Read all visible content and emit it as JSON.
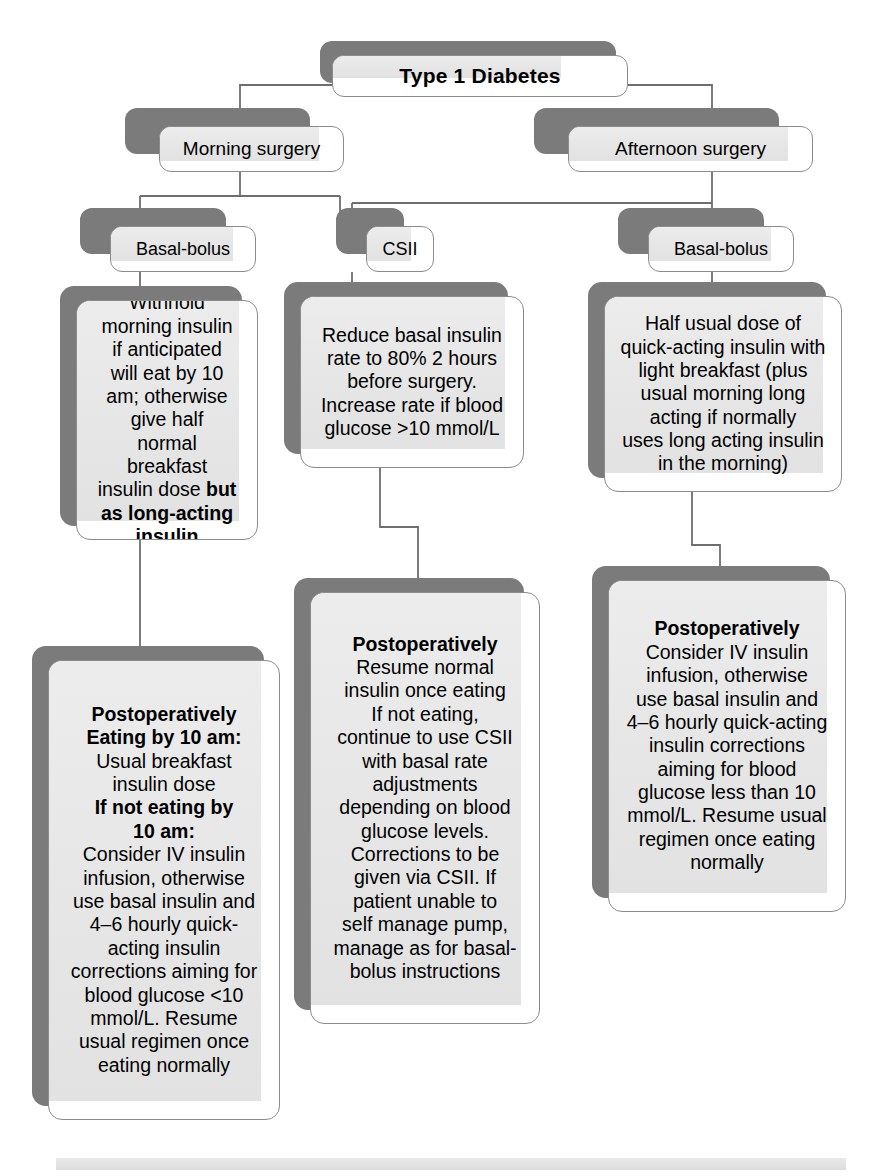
{
  "diagram": {
    "root": {
      "label": "Type 1 Diabetes"
    },
    "timing": [
      {
        "label": "Morning surgery"
      },
      {
        "label": "Afternoon surgery"
      }
    ],
    "regimens": [
      {
        "label": "Basal-bolus"
      },
      {
        "label": "CSII"
      },
      {
        "label": "Basal-bolus"
      }
    ],
    "preop": [
      {
        "name": "morning-basal-bolus-preop",
        "text_plain": "Withhold morning insulin if anticipated will eat by 10 am; otherwise give half normal breakfast insulin dose but as long-acting insulin",
        "lines": [
          {
            "text": "Withhold",
            "bold": false
          },
          {
            "text": "morning insulin",
            "bold": false
          },
          {
            "text": "if anticipated",
            "bold": false
          },
          {
            "text": "will eat by 10",
            "bold": false
          },
          {
            "text": "am; otherwise",
            "bold": false
          },
          {
            "text": "give half",
            "bold": false
          },
          {
            "text": "normal",
            "bold": false
          },
          {
            "text": "breakfast",
            "bold": false
          },
          {
            "text": "insulin dose ",
            "bold": false,
            "tail": "but",
            "tail_bold": true
          },
          {
            "text": "as long-acting",
            "bold": true
          },
          {
            "text": "insulin",
            "bold": true
          }
        ]
      },
      {
        "name": "csii-preop",
        "text_plain": "Reduce basal insulin rate to 80% 2 hours before surgery. Increase rate if blood glucose >10 mmol/L",
        "lines": [
          {
            "text": "Reduce basal insulin",
            "bold": false
          },
          {
            "text": "rate to 80% 2 hours",
            "bold": false
          },
          {
            "text": "before surgery.",
            "bold": false
          },
          {
            "text": "Increase rate if blood",
            "bold": false
          },
          {
            "text": "glucose >10 mmol/L",
            "bold": false
          }
        ]
      },
      {
        "name": "afternoon-basal-bolus-preop",
        "text_plain": "Half usual dose of quick-acting insulin with light breakfast (plus usual morning long acting if normally uses long acting insulin in the morning)",
        "lines": [
          {
            "text": "Half usual dose of",
            "bold": false
          },
          {
            "text": "quick-acting insulin with",
            "bold": false
          },
          {
            "text": "light breakfast (plus",
            "bold": false
          },
          {
            "text": "usual morning long",
            "bold": false
          },
          {
            "text": "acting if normally",
            "bold": false
          },
          {
            "text": "uses long acting insulin",
            "bold": false
          },
          {
            "text": "in the morning)",
            "bold": false
          }
        ]
      }
    ],
    "postop": [
      {
        "name": "morning-basal-bolus-postop",
        "text_plain": "Postoperatively Eating by 10 am: Usual breakfast insulin dose If not eating by 10 am: Consider IV insulin infusion, otherwise use basal insulin and 4–6 hourly quick-acting insulin corrections aiming for blood glucose <10 mmol/L. Resume usual regimen once eating normally",
        "lines": [
          {
            "text": "Postoperatively",
            "bold": true
          },
          {
            "text": "Eating by 10 am:",
            "bold": true
          },
          {
            "text": "Usual breakfast",
            "bold": false
          },
          {
            "text": "insulin dose",
            "bold": false
          },
          {
            "text": "If not eating by",
            "bold": true
          },
          {
            "text": "10 am:",
            "bold": true
          },
          {
            "text": "Consider IV insulin",
            "bold": false
          },
          {
            "text": "infusion, otherwise",
            "bold": false
          },
          {
            "text": "use basal insulin and",
            "bold": false
          },
          {
            "text": "4–6 hourly quick-",
            "bold": false
          },
          {
            "text": "acting insulin",
            "bold": false
          },
          {
            "text": "corrections aiming for",
            "bold": false
          },
          {
            "text": "blood glucose <10",
            "bold": false
          },
          {
            "text": "mmol/L. Resume",
            "bold": false
          },
          {
            "text": "usual regimen once",
            "bold": false
          },
          {
            "text": "eating normally",
            "bold": false
          }
        ]
      },
      {
        "name": "csii-postop",
        "text_plain": "Postoperatively Resume normal insulin once eating If not eating, continue to use CSII with basal rate adjustments depending on blood glucose levels. Corrections to be given via CSII. If patient unable to self manage pump, manage as for basal-bolus instructions",
        "lines": [
          {
            "text": "Postoperatively",
            "bold": true
          },
          {
            "text": "Resume normal",
            "bold": false
          },
          {
            "text": "insulin once eating",
            "bold": false
          },
          {
            "text": "If not eating,",
            "bold": false
          },
          {
            "text": "continue to use CSII",
            "bold": false
          },
          {
            "text": "with basal rate",
            "bold": false
          },
          {
            "text": "adjustments",
            "bold": false
          },
          {
            "text": "depending on blood",
            "bold": false
          },
          {
            "text": "glucose levels.",
            "bold": false
          },
          {
            "text": "Corrections to be",
            "bold": false
          },
          {
            "text": "given via CSII. If",
            "bold": false
          },
          {
            "text": "patient unable to",
            "bold": false
          },
          {
            "text": "self manage pump,",
            "bold": false
          },
          {
            "text": "manage as for basal-",
            "bold": false
          },
          {
            "text": "bolus instructions",
            "bold": false
          }
        ]
      },
      {
        "name": "afternoon-basal-bolus-postop",
        "text_plain": "Postoperatively Consider IV insulin infusion, otherwise use basal insulin and 4–6 hourly quick-acting insulin corrections aiming for blood glucose less than 10 mmol/L. Resume usual regimen once eating normally",
        "lines": [
          {
            "text": "Postoperatively",
            "bold": true
          },
          {
            "text": "Consider IV insulin",
            "bold": false
          },
          {
            "text": "infusion, otherwise",
            "bold": false
          },
          {
            "text": "use basal insulin and",
            "bold": false
          },
          {
            "text": "4–6 hourly quick-acting",
            "bold": false
          },
          {
            "text": "insulin corrections",
            "bold": false
          },
          {
            "text": "aiming for blood",
            "bold": false
          },
          {
            "text": "glucose less than 10",
            "bold": false
          },
          {
            "text": "mmol/L. Resume usual",
            "bold": false
          },
          {
            "text": "regimen once eating",
            "bold": false
          },
          {
            "text": "normally",
            "bold": false
          }
        ]
      }
    ],
    "colors": {
      "shadow": "#7b7b7b",
      "box_fill": "#e8e8e8",
      "box_border": "#8c8c8c",
      "connector": "#6e6e6e",
      "page_background": "#ffffff"
    }
  }
}
